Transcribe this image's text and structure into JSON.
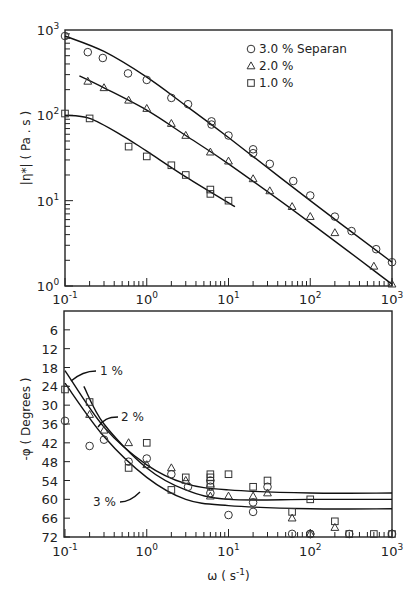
{
  "chart_data": [
    {
      "type": "scatter",
      "title": "",
      "xlabel": "ω (s⁻¹)",
      "ylabel": "|η*| ( Pa . s )",
      "xscale": "log",
      "yscale": "log",
      "xlim": [
        0.1,
        1000
      ],
      "ylim": [
        1,
        1000
      ],
      "x_tick_labels": [
        "10⁻¹",
        "10⁰",
        "10¹",
        "10²",
        "10³"
      ],
      "y_tick_labels": [
        "10⁰",
        "10¹",
        "10²",
        "10³"
      ],
      "grid": false,
      "legend_position": "upper right",
      "legend": [
        {
          "marker": "circle",
          "label": "3.0 %  Separan"
        },
        {
          "marker": "triangle",
          "label": "2.0 %"
        },
        {
          "marker": "square",
          "label": "1.0 %"
        }
      ],
      "series": [
        {
          "name": "3.0 % Separan",
          "marker": "circle",
          "x": [
            0.1,
            0.19,
            0.29,
            0.59,
            1.0,
            2.0,
            3.2,
            6.2,
            6.2,
            10,
            20,
            20,
            32,
            62,
            100,
            200,
            320,
            640,
            1000
          ],
          "y": [
            850,
            550,
            470,
            310,
            260,
            160,
            135,
            85,
            78,
            58,
            40,
            36,
            27,
            17,
            11.5,
            6.5,
            4.4,
            2.7,
            1.9
          ]
        },
        {
          "name": "2.0 %",
          "marker": "triangle",
          "x": [
            0.19,
            0.3,
            0.6,
            1.0,
            2.0,
            3.0,
            6.0,
            10,
            20,
            32,
            60,
            100,
            200,
            600,
            1000
          ],
          "y": [
            250,
            210,
            150,
            120,
            80,
            58,
            37,
            29,
            18,
            13,
            8.5,
            6.5,
            4.2,
            1.7,
            1.05
          ]
        },
        {
          "name": "1.0 %",
          "marker": "square",
          "x": [
            0.1,
            0.2,
            0.6,
            1.0,
            2.0,
            3.0,
            6.0,
            6.0,
            10
          ],
          "y": [
            105,
            92,
            43,
            33,
            26,
            20,
            13.5,
            12,
            10
          ]
        }
      ],
      "fit_curves": [
        {
          "name": "3.0 % fit",
          "x": [
            0.1,
            0.3,
            1,
            3,
            10,
            100,
            1000
          ],
          "y": [
            850,
            560,
            280,
            130,
            55,
            10,
            1.9
          ]
        },
        {
          "name": "2.0 % fit",
          "x": [
            0.15,
            0.3,
            1,
            3,
            10,
            100,
            1000
          ],
          "y": [
            290,
            210,
            115,
            58,
            27,
            5.5,
            1.05
          ]
        },
        {
          "name": "1.0 % fit",
          "x": [
            0.1,
            0.2,
            0.5,
            1,
            3,
            12
          ],
          "y": [
            100,
            92,
            58,
            38,
            19,
            8.5
          ]
        }
      ]
    },
    {
      "type": "scatter",
      "title": "",
      "xlabel": "ω ( s⁻¹)",
      "ylabel": "-φ ( Degrees )",
      "xscale": "log",
      "xlim": [
        0.1,
        1000
      ],
      "ylim": [
        72,
        0
      ],
      "x_tick_labels": [
        "10⁻¹",
        "10⁰",
        "10¹",
        "10²",
        "10³"
      ],
      "y_tick_labels": [
        "6",
        "12",
        "18",
        "24",
        "30",
        "36",
        "42",
        "48",
        "54",
        "60",
        "66",
        "72"
      ],
      "grid": false,
      "annotations": [
        "1 %",
        "2 %",
        "3 %"
      ],
      "series": [
        {
          "name": "3 %",
          "marker": "circle",
          "x": [
            0.1,
            0.2,
            0.3,
            0.6,
            1.0,
            2.0,
            3.2,
            6.0,
            6.0,
            6.0,
            10,
            20,
            20,
            30,
            60,
            100,
            100,
            300,
            1000
          ],
          "y": [
            35,
            43,
            41,
            48,
            47,
            52,
            56,
            54,
            56,
            58,
            65,
            64,
            61,
            56,
            71,
            72,
            73,
            73,
            73
          ]
        },
        {
          "name": "2 %",
          "marker": "triangle",
          "x": [
            0.2,
            0.3,
            0.6,
            1.0,
            2.0,
            3.0,
            6.0,
            10,
            20,
            30,
            60,
            100,
            200
          ],
          "y": [
            33,
            38,
            42,
            49,
            50,
            54,
            59,
            59,
            59,
            58,
            66,
            71,
            69
          ]
        },
        {
          "name": "1 %",
          "marker": "square",
          "x": [
            0.1,
            0.2,
            0.6,
            1.0,
            2.0,
            3.0,
            6.0,
            6.0,
            6.0,
            10,
            20,
            30,
            60,
            100,
            200,
            300,
            600,
            1000
          ],
          "y": [
            25,
            29,
            50,
            42,
            57,
            53,
            52,
            53,
            55,
            52,
            56,
            54,
            64,
            60,
            67,
            72,
            73,
            73
          ]
        }
      ],
      "fit_curves": [
        {
          "name": "1 % fit",
          "x": [
            0.1,
            0.3,
            1,
            3,
            10,
            100,
            1000
          ],
          "y": [
            19,
            37,
            49,
            55,
            57,
            58,
            58
          ]
        },
        {
          "name": "2 % fit",
          "x": [
            0.17,
            0.3,
            1,
            3,
            10,
            100,
            1000
          ],
          "y": [
            24,
            36,
            50,
            57,
            60,
            60,
            60
          ]
        },
        {
          "name": "3 % fit",
          "x": [
            0.1,
            0.3,
            1,
            3,
            10,
            100,
            1000
          ],
          "y": [
            23,
            40,
            53,
            60,
            62,
            63,
            63
          ]
        }
      ]
    }
  ],
  "labels": {
    "top_ylabel": "|η*| ( Pa . s )",
    "bottom_ylabel": "-φ ( Degrees )",
    "bottom_xlabel": "ω ( s⁻¹)",
    "legend_3": "3.0 %  Separan",
    "legend_2": "2.0 %",
    "legend_1": "1.0 %",
    "ann_1": "1 %",
    "ann_2": "2 %",
    "ann_3": "3 %"
  }
}
